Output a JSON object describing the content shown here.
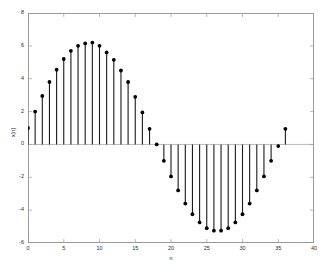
{
  "chart_data": {
    "type": "scatter",
    "style": "stem",
    "title": "",
    "xlabel": "n",
    "ylabel": "x[n]",
    "xlim": [
      0,
      40
    ],
    "ylim": [
      -6,
      8
    ],
    "xticks": [
      0,
      5,
      10,
      15,
      20,
      25,
      30,
      35,
      40
    ],
    "xtick_labels": [
      "0",
      "5",
      "10",
      "15",
      "20",
      "25",
      "30",
      "35",
      "40"
    ],
    "yticks": [
      -6,
      -4,
      -2,
      0,
      2,
      4,
      6,
      8
    ],
    "ytick_labels": [
      "-6",
      "-4",
      "-2",
      "0",
      "2",
      "4",
      "6",
      "8"
    ],
    "grid": false,
    "legend": null,
    "baseline": 0,
    "marker": "filled-circle",
    "marker_color": "#000000",
    "stem_color": "#1a1a1a",
    "axis_color": "#9a9a9a",
    "x": [
      0,
      1,
      2,
      3,
      4,
      5,
      6,
      7,
      8,
      9,
      10,
      11,
      12,
      13,
      14,
      15,
      16,
      17,
      18,
      19,
      20,
      21,
      22,
      23,
      24,
      25,
      26,
      27,
      28,
      29,
      30,
      31,
      32,
      33,
      34,
      35,
      36
    ],
    "values": [
      1.0,
      2.0,
      2.95,
      3.8,
      4.55,
      5.2,
      5.7,
      6.0,
      6.15,
      6.2,
      6.0,
      5.6,
      5.15,
      4.5,
      3.8,
      2.9,
      1.95,
      0.95,
      0.0,
      -1.0,
      -1.95,
      -2.8,
      -3.6,
      -4.25,
      -4.75,
      -5.1,
      -5.25,
      -5.25,
      -5.1,
      -4.75,
      -4.25,
      -3.6,
      -2.8,
      -1.95,
      -1.0,
      -0.1,
      0.95
    ]
  }
}
